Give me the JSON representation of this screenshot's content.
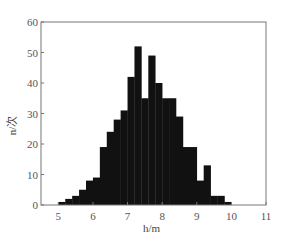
{
  "chart_data": {
    "type": "bar",
    "subtype": "histogram",
    "title": "",
    "xlabel": "h/m",
    "ylabel": "n/次",
    "xlim": [
      4.5,
      11
    ],
    "ylim": [
      0,
      60
    ],
    "x_ticks": [
      5,
      6,
      7,
      8,
      9,
      10,
      11
    ],
    "y_ticks": [
      0,
      10,
      20,
      30,
      40,
      50,
      60
    ],
    "grid": false,
    "legend": null,
    "bin_width": 0.2,
    "bin_edges_start": [
      5.0,
      5.2,
      5.4,
      5.6,
      5.8,
      6.0,
      6.2,
      6.4,
      6.6,
      6.8,
      7.0,
      7.2,
      7.4,
      7.6,
      7.8,
      8.0,
      8.2,
      8.4,
      8.6,
      8.8,
      9.0,
      9.2,
      9.4,
      9.6,
      9.8
    ],
    "values": [
      1,
      2,
      3,
      5,
      8,
      9,
      19,
      24,
      28,
      31,
      42,
      52,
      35,
      49,
      40,
      35,
      35,
      29,
      19,
      19,
      8,
      13,
      3,
      3,
      1
    ],
    "bar_color": "#111111",
    "axis_color": "#777777"
  }
}
